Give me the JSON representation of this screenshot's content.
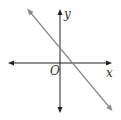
{
  "diagram": {
    "type": "coordinate-plane",
    "axes": {
      "x_label": "x",
      "y_label": "y",
      "origin_label": "O"
    },
    "line": {
      "slope": "negative",
      "y_intercept": "positive",
      "x_intercept": "positive",
      "color": "#8a8a8a"
    },
    "axis_color": "#222222"
  }
}
